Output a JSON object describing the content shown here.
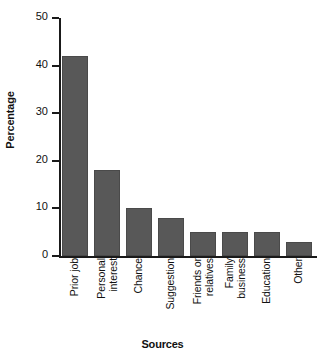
{
  "chart_data": {
    "type": "bar",
    "title": "",
    "xlabel": "Sources",
    "ylabel": "Percentage",
    "categories": [
      "Prior job",
      "Personal interest",
      "Chance",
      "Suggestion",
      "Friends or relatives",
      "Family business",
      "Education",
      "Other"
    ],
    "category_lines": [
      [
        "Prior job"
      ],
      [
        "Personal",
        "interest"
      ],
      [
        "Chance"
      ],
      [
        "Suggestion"
      ],
      [
        "Friends or",
        "relatives"
      ],
      [
        "Family",
        "business"
      ],
      [
        "Education"
      ],
      [
        "Other"
      ]
    ],
    "values": [
      42,
      18,
      10,
      8,
      5,
      5,
      5,
      3
    ],
    "ylim": [
      0,
      50
    ],
    "yticks": [
      0,
      10,
      20,
      30,
      40,
      50
    ],
    "ytick_labels": [
      "0",
      "10",
      "20",
      "30",
      "40",
      "50"
    ],
    "grid": false,
    "legend": false,
    "bar_color": "#585858",
    "axis_color": "#1a1a1a",
    "background": "#ffffff"
  }
}
